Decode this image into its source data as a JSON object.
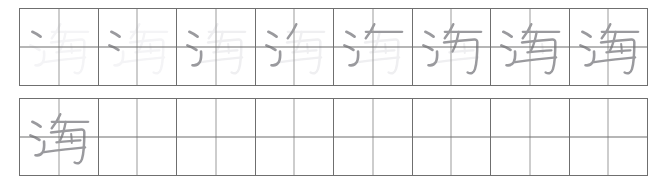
{
  "worksheet": {
    "title": "Chinese character stroke-order practice sheet",
    "character": "海",
    "character_pinyin": "hǎi",
    "total_strokes": 10,
    "grid_style": "tian-zi-ge",
    "rows": [
      {
        "name": "stroke-order-row",
        "cell_count": 8,
        "cells": [
          {
            "index": 1,
            "strokes_shown": 1,
            "ghost_opacity": "very-faint",
            "label": "stroke-step-1"
          },
          {
            "index": 2,
            "strokes_shown": 2,
            "ghost_opacity": "very-faint",
            "label": "stroke-step-2"
          },
          {
            "index": 3,
            "strokes_shown": 3,
            "ghost_opacity": "faint",
            "label": "stroke-step-3"
          },
          {
            "index": 4,
            "strokes_shown": 4,
            "ghost_opacity": "faint",
            "label": "stroke-step-4"
          },
          {
            "index": 5,
            "strokes_shown": 5,
            "ghost_opacity": "faint",
            "label": "stroke-step-5"
          },
          {
            "index": 6,
            "strokes_shown": 7,
            "ghost_opacity": "faint",
            "label": "stroke-step-6"
          },
          {
            "index": 7,
            "strokes_shown": 9,
            "ghost_opacity": "faint",
            "label": "stroke-step-7"
          },
          {
            "index": 8,
            "strokes_shown": 10,
            "ghost_opacity": "none",
            "label": "stroke-step-8"
          }
        ]
      },
      {
        "name": "practice-row",
        "cell_count": 8,
        "cells": [
          {
            "index": 1,
            "strokes_shown": 10,
            "ghost_opacity": "none",
            "label": "practice-model"
          },
          {
            "index": 2,
            "strokes_shown": 0,
            "ghost_opacity": "none",
            "label": "practice-blank"
          },
          {
            "index": 3,
            "strokes_shown": 0,
            "ghost_opacity": "none",
            "label": "practice-blank"
          },
          {
            "index": 4,
            "strokes_shown": 0,
            "ghost_opacity": "none",
            "label": "practice-blank"
          },
          {
            "index": 5,
            "strokes_shown": 0,
            "ghost_opacity": "none",
            "label": "practice-blank"
          },
          {
            "index": 6,
            "strokes_shown": 0,
            "ghost_opacity": "none",
            "label": "practice-blank"
          },
          {
            "index": 7,
            "strokes_shown": 0,
            "ghost_opacity": "none",
            "label": "practice-blank"
          },
          {
            "index": 8,
            "strokes_shown": 0,
            "ghost_opacity": "none",
            "label": "practice-blank"
          }
        ]
      }
    ]
  },
  "colors": {
    "cell_border": "#6f6f6f",
    "center_guide": "#9b9b9b",
    "stroke_done": "#9a9a9e",
    "stroke_ghost": "#efeff1",
    "background": "#ffffff"
  },
  "strokes": {
    "note": "Path data for the 10 strokes of 海 in a 100x100 cell box, in stroke order.",
    "paths": [
      "M16,30 C19.5,31.6 23,33.7 26.5,36.4",
      "M13.5,48 C17.5,49.2 21.5,51.2 25,53.8",
      "M20,74 C24,74.6 27.5,73.2 29.5,69.5 C31,66.5 31.5,62 31,56",
      "M52,20 C49,27 45.5,33 41,38.5",
      "M41,30 L88,30",
      "M59,30 C57,41 54.5,49.5 51,56",
      "M40,44 C53,42.5 66,41.2 79,40.2 C81.5,40 83,41.3 83,43.6 C83,60 82,72 80,79 C78.5,84 75,86 70.5,83.5",
      "M47,57 C57,56 68,55 78,54.4",
      "M31,70 C48,67.5 66,65.2 84,63.6",
      "M66,46 C66.5,50 66.8,54 66.8,58"
    ]
  }
}
